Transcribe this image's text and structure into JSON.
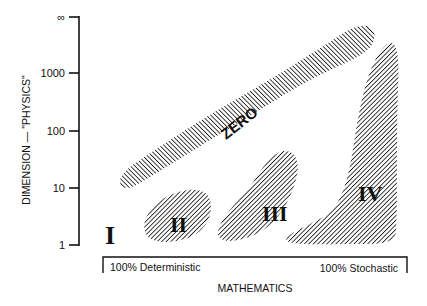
{
  "figure": {
    "y_axis": {
      "label": "DIMENSION — \"PHYSICS\"",
      "ticks": [
        "∞",
        "1000",
        "100",
        "10",
        "1"
      ]
    },
    "x_axis": {
      "label": "MATHEMATICS",
      "left_end": "100% Deterministic",
      "right_end": "100% Stochastic"
    },
    "regions": [
      {
        "id": "I",
        "label": "I",
        "fill": "none"
      },
      {
        "id": "II",
        "label": "II",
        "fill": "hatched"
      },
      {
        "id": "III",
        "label": "III",
        "fill": "hatched"
      },
      {
        "id": "IV",
        "label": "IV",
        "fill": "hatched"
      },
      {
        "id": "zero",
        "label": "ZERO",
        "fill": "hatched"
      }
    ],
    "colors": {
      "ink": "#111111",
      "background": "#ffffff"
    }
  }
}
